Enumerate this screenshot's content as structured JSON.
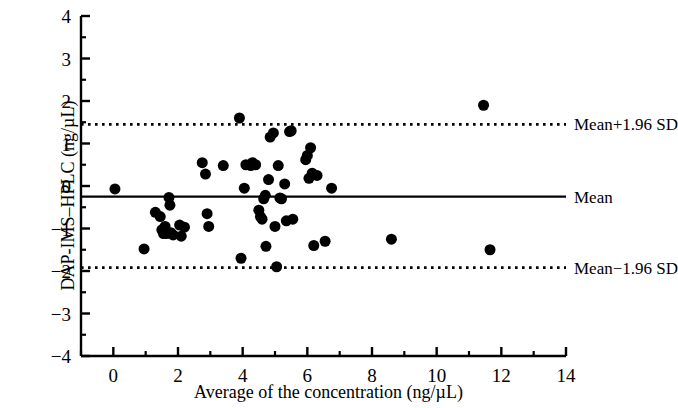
{
  "chart_data": {
    "type": "scatter",
    "title": "",
    "xlabel": "Average of the concentration (ng/µL)",
    "ylabel": "DAP-IMS–HPLC (ng/µL)",
    "xlim": [
      -1,
      14
    ],
    "ylim": [
      -4,
      4
    ],
    "xticks": [
      0,
      2,
      4,
      6,
      8,
      10,
      12,
      14
    ],
    "xtick_labels": [
      "0",
      "2",
      "4",
      "6",
      "8",
      "10",
      "12",
      "14"
    ],
    "x_minor_tick_step": 1,
    "yticks": [
      -4,
      -3,
      -2,
      -1,
      0,
      1,
      2,
      3,
      4
    ],
    "ytick_labels": [
      "−4",
      "−3",
      "−2",
      "−1",
      "0",
      "1",
      "2",
      "3",
      "4"
    ],
    "y_minor_tick_step": 0.5,
    "grid": false,
    "legend": "none",
    "marker": {
      "shape": "circle",
      "color": "#000000",
      "size_px": 11
    },
    "reference_lines": [
      {
        "name": "upper-limit-of-agreement",
        "label": "Mean+1.96 SD",
        "value": 1.45,
        "style": "dotted",
        "color": "#000000"
      },
      {
        "name": "mean-line",
        "label": "Mean",
        "value": -0.25,
        "style": "solid",
        "color": "#000000"
      },
      {
        "name": "lower-limit-of-agreement",
        "label": "Mean−1.96 SD",
        "value": -1.92,
        "style": "dotted",
        "color": "#000000"
      }
    ],
    "points": [
      [
        0.05,
        -0.07
      ],
      [
        0.95,
        -1.48
      ],
      [
        1.3,
        -0.62
      ],
      [
        1.45,
        -0.72
      ],
      [
        1.5,
        -1.03
      ],
      [
        1.55,
        -1.12
      ],
      [
        1.6,
        -0.95
      ],
      [
        1.65,
        -1.12
      ],
      [
        1.72,
        -0.27
      ],
      [
        1.75,
        -0.45
      ],
      [
        1.78,
        -1.1
      ],
      [
        1.85,
        -1.15
      ],
      [
        2.05,
        -0.92
      ],
      [
        2.1,
        -1.18
      ],
      [
        2.2,
        -0.97
      ],
      [
        2.75,
        0.55
      ],
      [
        2.85,
        0.28
      ],
      [
        2.9,
        -0.65
      ],
      [
        2.95,
        -0.95
      ],
      [
        3.4,
        0.48
      ],
      [
        3.9,
        1.6
      ],
      [
        3.95,
        -1.7
      ],
      [
        4.05,
        -0.05
      ],
      [
        4.1,
        0.5
      ],
      [
        4.25,
        0.48
      ],
      [
        4.3,
        0.55
      ],
      [
        4.4,
        0.5
      ],
      [
        4.5,
        -0.57
      ],
      [
        4.55,
        -0.72
      ],
      [
        4.6,
        -0.78
      ],
      [
        4.65,
        -0.3
      ],
      [
        4.7,
        -0.22
      ],
      [
        4.72,
        -1.42
      ],
      [
        4.8,
        0.15
      ],
      [
        4.85,
        1.15
      ],
      [
        4.95,
        1.25
      ],
      [
        5.0,
        -0.95
      ],
      [
        5.05,
        -1.9
      ],
      [
        5.1,
        0.48
      ],
      [
        5.15,
        -0.28
      ],
      [
        5.2,
        -0.3
      ],
      [
        5.3,
        0.05
      ],
      [
        5.35,
        -0.82
      ],
      [
        5.45,
        1.28
      ],
      [
        5.5,
        1.3
      ],
      [
        5.55,
        -0.78
      ],
      [
        5.95,
        0.62
      ],
      [
        6.0,
        0.72
      ],
      [
        6.05,
        0.18
      ],
      [
        6.1,
        0.9
      ],
      [
        6.15,
        0.3
      ],
      [
        6.2,
        -1.4
      ],
      [
        6.3,
        0.25
      ],
      [
        6.55,
        -1.3
      ],
      [
        6.75,
        -0.05
      ],
      [
        8.6,
        -1.25
      ],
      [
        11.45,
        1.9
      ],
      [
        11.65,
        -1.5
      ]
    ]
  },
  "axis_titles": {
    "x": "Average of the concentration (ng/µL)",
    "y": "DAP-IMS–HPLC (ng/µL)"
  }
}
